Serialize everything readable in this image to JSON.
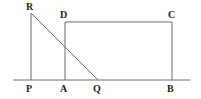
{
  "figure": {
    "canvas": {
      "width": 201,
      "height": 99
    },
    "style": {
      "background_color": "#ffffff",
      "line_color": "#6b6b6b",
      "baseline_color": "#6b6b6b",
      "label_color": "#1d1d1d",
      "line_width": 1
    },
    "baseline": {
      "name": "ground-line",
      "y": 80,
      "x_start": 13,
      "x_end": 190
    },
    "points": [
      {
        "id": "P",
        "label": "P",
        "x": 31,
        "y": 80,
        "label_x": 26,
        "label_y": 84
      },
      {
        "id": "A",
        "label": "A",
        "x": 65,
        "y": 80,
        "label_x": 60,
        "label_y": 84
      },
      {
        "id": "Q",
        "label": "Q",
        "x": 98,
        "y": 80,
        "label_x": 93,
        "label_y": 84
      },
      {
        "id": "B",
        "label": "B",
        "x": 172,
        "y": 80,
        "label_x": 167,
        "label_y": 84
      },
      {
        "id": "R",
        "label": "R",
        "x": 31,
        "y": 13,
        "label_x": 26,
        "label_y": 2
      },
      {
        "id": "D",
        "label": "D",
        "x": 65,
        "y": 22,
        "label_x": 60,
        "label_y": 10
      },
      {
        "id": "C",
        "label": "C",
        "x": 172,
        "y": 22,
        "label_x": 168,
        "label_y": 10
      }
    ],
    "segments": [
      {
        "id": "baseline",
        "name": "ground-line",
        "x1": 13,
        "y1": 80,
        "x2": 190,
        "y2": 80
      },
      {
        "id": "PR",
        "name": "segment-p-r",
        "x1": 31,
        "y1": 80,
        "x2": 31,
        "y2": 13
      },
      {
        "id": "RQ",
        "name": "segment-r-q",
        "x1": 31,
        "y1": 13,
        "x2": 98,
        "y2": 80
      },
      {
        "id": "AD",
        "name": "segment-a-d",
        "x1": 65,
        "y1": 80,
        "x2": 65,
        "y2": 22
      },
      {
        "id": "DC",
        "name": "segment-d-c",
        "x1": 65,
        "y1": 22,
        "x2": 172,
        "y2": 22
      },
      {
        "id": "CB",
        "name": "segment-c-b",
        "x1": 172,
        "y1": 22,
        "x2": 172,
        "y2": 80
      }
    ]
  }
}
